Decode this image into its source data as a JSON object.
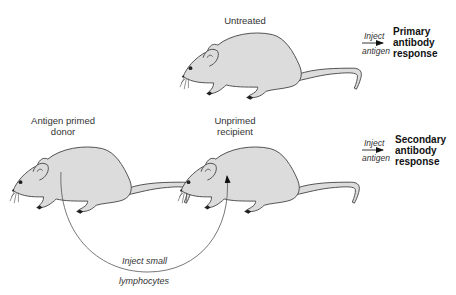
{
  "diagram": {
    "colors": {
      "mouse_fill": "#dcdcdc",
      "outline": "#4a4a4a",
      "background": "#ffffff"
    },
    "rows": [
      {
        "mice": [
          {
            "id": "untreated",
            "label": "Untreated"
          }
        ],
        "arrow": {
          "above": "Inject",
          "below": "antigen"
        },
        "result": [
          "Primary",
          "antibody",
          "response"
        ]
      },
      {
        "mice": [
          {
            "id": "donor",
            "label_lines": [
              "Antigen primed",
              "donor"
            ]
          },
          {
            "id": "recipient",
            "label_lines": [
              "Unprimed",
              "recipient"
            ]
          }
        ],
        "arrow": {
          "above": "Inject",
          "below": "antigen"
        },
        "result": [
          "Secondary",
          "antibody",
          "response"
        ]
      }
    ],
    "transfer_arrow": {
      "above": "Inject small",
      "below": "lymphocytes",
      "from": "donor",
      "to": "recipient"
    }
  }
}
